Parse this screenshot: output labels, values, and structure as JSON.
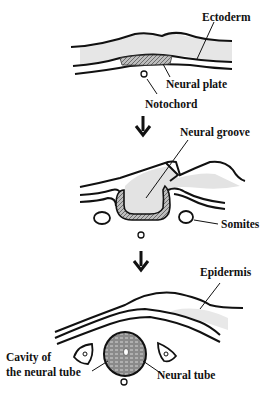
{
  "stages": [
    {
      "id": "stage-1",
      "labels": {
        "ectoderm": "Ectoderm",
        "neural_plate": "Neural plate",
        "notochord": "Notochord"
      }
    },
    {
      "id": "stage-2",
      "labels": {
        "neural_groove": "Neural groove",
        "somites": "Somites"
      }
    },
    {
      "id": "stage-3",
      "labels": {
        "epidermis": "Epidermis",
        "cavity_line1": "Cavity of",
        "cavity_line2": "the neural tube",
        "neural_tube": "Neural tube"
      }
    }
  ],
  "arrows": [
    "down-arrow",
    "down-arrow"
  ],
  "colors": {
    "line": "#111111",
    "shade": "#d9d9d9",
    "hatch": "#777777",
    "background": "#ffffff"
  }
}
